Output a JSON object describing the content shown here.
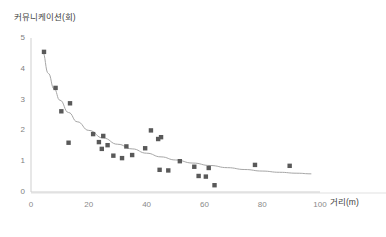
{
  "chart_data": {
    "type": "scatter",
    "title": "",
    "ylabel": "커뮤니케이션(회)",
    "xlabel": "거리(m)",
    "xlim": [
      0,
      100
    ],
    "ylim": [
      0,
      5
    ],
    "xticks": [
      "0",
      "20",
      "40",
      "60",
      "80",
      "100"
    ],
    "yticks": [
      "0",
      "1",
      "2",
      "3",
      "4",
      "5"
    ],
    "grid": false,
    "legend": "none",
    "marker_color": "#595959",
    "marker_shape": "square",
    "trendline_color": "#a6a6a6",
    "trendline_note": "power/logarithmic decay fit",
    "points": [
      {
        "x": 4.5,
        "y": 4.55
      },
      {
        "x": 8.5,
        "y": 3.38
      },
      {
        "x": 10.5,
        "y": 2.62
      },
      {
        "x": 13.5,
        "y": 2.88
      },
      {
        "x": 13.0,
        "y": 1.6
      },
      {
        "x": 21.5,
        "y": 1.88
      },
      {
        "x": 23.5,
        "y": 1.62
      },
      {
        "x": 24.5,
        "y": 1.4
      },
      {
        "x": 25.0,
        "y": 1.82
      },
      {
        "x": 26.5,
        "y": 1.52
      },
      {
        "x": 28.5,
        "y": 1.18
      },
      {
        "x": 31.5,
        "y": 1.1
      },
      {
        "x": 33.0,
        "y": 1.48
      },
      {
        "x": 35.0,
        "y": 1.2
      },
      {
        "x": 39.5,
        "y": 1.42
      },
      {
        "x": 41.5,
        "y": 2.0
      },
      {
        "x": 44.0,
        "y": 1.72
      },
      {
        "x": 45.0,
        "y": 1.78
      },
      {
        "x": 44.5,
        "y": 0.72
      },
      {
        "x": 47.5,
        "y": 0.7
      },
      {
        "x": 51.5,
        "y": 1.0
      },
      {
        "x": 56.5,
        "y": 0.82
      },
      {
        "x": 58.0,
        "y": 0.52
      },
      {
        "x": 60.5,
        "y": 0.5
      },
      {
        "x": 61.5,
        "y": 0.78
      },
      {
        "x": 63.5,
        "y": 0.22
      },
      {
        "x": 77.5,
        "y": 0.88
      },
      {
        "x": 89.5,
        "y": 0.85
      }
    ],
    "trendline": [
      {
        "x": 4.0,
        "y": 4.55
      },
      {
        "x": 6.0,
        "y": 3.85
      },
      {
        "x": 8.0,
        "y": 3.35
      },
      {
        "x": 10.0,
        "y": 2.98
      },
      {
        "x": 13.0,
        "y": 2.58
      },
      {
        "x": 16.0,
        "y": 2.28
      },
      {
        "x": 20.0,
        "y": 2.0
      },
      {
        "x": 25.0,
        "y": 1.75
      },
      {
        "x": 30.0,
        "y": 1.55
      },
      {
        "x": 35.0,
        "y": 1.4
      },
      {
        "x": 40.0,
        "y": 1.26
      },
      {
        "x": 45.0,
        "y": 1.14
      },
      {
        "x": 50.0,
        "y": 1.04
      },
      {
        "x": 56.0,
        "y": 0.94
      },
      {
        "x": 62.0,
        "y": 0.86
      },
      {
        "x": 68.0,
        "y": 0.79
      },
      {
        "x": 74.0,
        "y": 0.73
      },
      {
        "x": 80.0,
        "y": 0.68
      },
      {
        "x": 86.0,
        "y": 0.64
      },
      {
        "x": 92.0,
        "y": 0.61
      },
      {
        "x": 97.0,
        "y": 0.59
      }
    ]
  },
  "caption": ""
}
